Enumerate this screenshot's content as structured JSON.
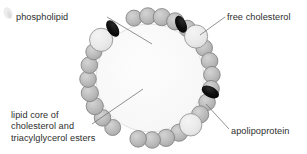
{
  "figure": {
    "background_color": "#ffffff"
  },
  "labels": {
    "phospholipid": "phospholipid",
    "free_cholesterol": "free cholesterol",
    "apolipoprotein": "apolipoprotein",
    "lipid_core_line1": "lipid core of",
    "lipid_core_line2": "cholesterol and",
    "lipid_core_line3": "triacylglycerol esters"
  },
  "colors": {
    "phospholipid_fill": "#b9b9b9",
    "phospholipid_stroke": "#7d7d7d",
    "cholesterol_fill": "#e8e8e8",
    "cholesterol_stroke": "#8a8a8a",
    "apolipoprotein_fill": "#0d0d0d",
    "core_fill": "#fbfbfb",
    "core_stroke": "#d8d8d8",
    "leader_line": "#6e6e6e",
    "text": "#2e2e2e"
  },
  "diagram": {
    "center_x": 150,
    "center_y": 78,
    "core_radius": 54,
    "shell_radius": 62,
    "phospholipid_radius": 8.3,
    "cholesterol_radius": 11.5,
    "phospholipid_count": 22,
    "cholesterol_count": 3,
    "apolipoprotein_count": 3,
    "phospholipids": [
      {
        "angle": 255,
        "r": 8.0
      },
      {
        "angle": 268,
        "r": 8.3
      },
      {
        "angle": 281,
        "r": 8.6
      },
      {
        "angle": 294,
        "r": 8.6
      },
      {
        "angle": 307,
        "r": 8.3
      },
      {
        "angle": 331,
        "r": 8.3
      },
      {
        "angle": 344,
        "r": 8.3
      },
      {
        "angle": 357,
        "r": 8.3
      },
      {
        "angle": 10,
        "r": 8.3
      },
      {
        "angle": 23,
        "r": 8.3
      },
      {
        "angle": 36,
        "r": 8.6
      },
      {
        "angle": 62,
        "r": 8.6
      },
      {
        "angle": 75,
        "r": 8.6
      },
      {
        "angle": 88,
        "r": 8.3
      },
      {
        "angle": 101,
        "r": 8.3
      },
      {
        "angle": 127,
        "r": 8.0
      },
      {
        "angle": 140,
        "r": 8.3
      },
      {
        "angle": 153,
        "r": 8.6
      },
      {
        "angle": 166,
        "r": 8.6
      },
      {
        "angle": 179,
        "r": 8.3
      },
      {
        "angle": 192,
        "r": 8.3
      },
      {
        "angle": 205,
        "r": 8.0
      }
    ],
    "cholesterols": [
      {
        "angle": 318,
        "r": 11.6
      },
      {
        "angle": 49,
        "r": 11.2
      },
      {
        "angle": 218,
        "r": 11.6
      }
    ],
    "apolipoproteins": [
      {
        "angle": 300,
        "rx": 9.0,
        "ry": 5.2,
        "rot": 66
      },
      {
        "angle": 13,
        "rx": 9.4,
        "ry": 5.4,
        "rot": 28
      },
      {
        "angle": 233,
        "rx": 9.2,
        "ry": 5.3,
        "rot": 58
      }
    ],
    "leaders": [
      {
        "name": "phospholipid",
        "x1": 107,
        "y1": 17,
        "x2": 152,
        "y2": 44
      },
      {
        "name": "free-cholesterol",
        "x1": 225,
        "y1": 17,
        "x2": 200,
        "y2": 35
      },
      {
        "name": "lipid-core",
        "x1": 92,
        "y1": 124,
        "x2": 143,
        "y2": 89
      },
      {
        "name": "apolipoprotein",
        "x1": 229,
        "y1": 129,
        "x2": 206,
        "y2": 104
      }
    ]
  }
}
